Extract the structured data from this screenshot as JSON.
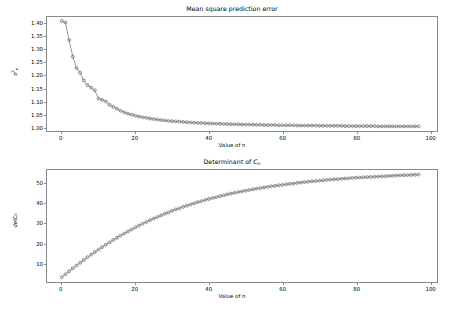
{
  "figure": {
    "background": "#ffffff",
    "frame_color": "#8a8a8a",
    "marker_color": "#6b6b6b",
    "line_color": "#555555"
  },
  "chart_data": [
    {
      "type": "line",
      "title": "Mean square prediction error",
      "xlabel": "Value of n",
      "ylabel": "σ²ₙ",
      "ylabel_parts": {
        "base": "σ",
        "sup": "2",
        "sub": "n"
      },
      "grid": false,
      "legend": null,
      "marker": "circle",
      "xlim": [
        -4,
        102
      ],
      "ylim": [
        0.985,
        1.425
      ],
      "xticks": [
        0,
        20,
        40,
        60,
        80,
        100
      ],
      "xticklabels": [
        "0",
        "20",
        "40",
        "60",
        "80",
        "100"
      ],
      "yticks": [
        1.0,
        1.05,
        1.1,
        1.15,
        1.2,
        1.25,
        1.3,
        1.35,
        1.4
      ],
      "yticklabels": [
        "1.00",
        "1.05",
        "1.10",
        "1.15",
        "1.20",
        "1.25",
        "1.30",
        "1.35",
        "1.40"
      ],
      "x": [
        0,
        1,
        2,
        3,
        4,
        5,
        6,
        7,
        8,
        9,
        10,
        11,
        12,
        13,
        14,
        15,
        16,
        17,
        18,
        19,
        20,
        21,
        22,
        23,
        24,
        25,
        26,
        27,
        28,
        29,
        30,
        31,
        32,
        33,
        34,
        35,
        36,
        37,
        38,
        39,
        40,
        41,
        42,
        43,
        44,
        45,
        46,
        47,
        48,
        49,
        50,
        51,
        52,
        53,
        54,
        55,
        56,
        57,
        58,
        59,
        60,
        61,
        62,
        63,
        64,
        65,
        66,
        67,
        68,
        69,
        70,
        71,
        72,
        73,
        74,
        75,
        76,
        77,
        78,
        79,
        80,
        81,
        82,
        83,
        84,
        85,
        86,
        87,
        88,
        89,
        90,
        91,
        92,
        93,
        94,
        95,
        96,
        97
      ],
      "y": [
        1.41,
        1.404,
        1.336,
        1.272,
        1.228,
        1.21,
        1.18,
        1.162,
        1.152,
        1.142,
        1.11,
        1.105,
        1.099,
        1.086,
        1.078,
        1.071,
        1.063,
        1.057,
        1.052,
        1.048,
        1.044,
        1.041,
        1.038,
        1.036,
        1.033,
        1.031,
        1.029,
        1.027,
        1.026,
        1.024,
        1.023,
        1.022,
        1.021,
        1.02,
        1.019,
        1.018,
        1.017,
        1.016,
        1.016,
        1.015,
        1.014,
        1.014,
        1.013,
        1.013,
        1.012,
        1.012,
        1.011,
        1.011,
        1.011,
        1.01,
        1.01,
        1.01,
        1.009,
        1.009,
        1.009,
        1.008,
        1.008,
        1.008,
        1.008,
        1.007,
        1.007,
        1.007,
        1.007,
        1.007,
        1.006,
        1.006,
        1.006,
        1.006,
        1.006,
        1.006,
        1.005,
        1.005,
        1.005,
        1.005,
        1.005,
        1.005,
        1.005,
        1.004,
        1.004,
        1.004,
        1.004,
        1.004,
        1.004,
        1.004,
        1.004,
        1.004,
        1.003,
        1.003,
        1.003,
        1.003,
        1.003,
        1.003,
        1.003,
        1.003,
        1.003,
        1.003,
        1.003,
        1.003
      ]
    },
    {
      "type": "line",
      "title": "Determinant of Cₙ",
      "title_parts": {
        "prefix": "Determinant of ",
        "base": "C",
        "sub": "n"
      },
      "xlabel": "Value of n",
      "ylabel": "detCₙ",
      "ylabel_parts": {
        "base": "detC",
        "sub": "n"
      },
      "grid": false,
      "legend": null,
      "marker": "circle",
      "xlim": [
        -4,
        102
      ],
      "ylim": [
        0.5,
        57
      ],
      "xticks": [
        0,
        20,
        40,
        60,
        80,
        100
      ],
      "xticklabels": [
        "0",
        "20",
        "40",
        "60",
        "80",
        "100"
      ],
      "yticks": [
        10,
        20,
        30,
        40,
        50
      ],
      "yticklabels": [
        "10",
        "20",
        "30",
        "40",
        "50"
      ],
      "x": [
        0,
        1,
        2,
        3,
        4,
        5,
        6,
        7,
        8,
        9,
        10,
        11,
        12,
        13,
        14,
        15,
        16,
        17,
        18,
        19,
        20,
        21,
        22,
        23,
        24,
        25,
        26,
        27,
        28,
        29,
        30,
        31,
        32,
        33,
        34,
        35,
        36,
        37,
        38,
        39,
        40,
        41,
        42,
        43,
        44,
        45,
        46,
        47,
        48,
        49,
        50,
        51,
        52,
        53,
        54,
        55,
        56,
        57,
        58,
        59,
        60,
        61,
        62,
        63,
        64,
        65,
        66,
        67,
        68,
        69,
        70,
        71,
        72,
        73,
        74,
        75,
        76,
        77,
        78,
        79,
        80,
        81,
        82,
        83,
        84,
        85,
        86,
        87,
        88,
        89,
        90,
        91,
        92,
        93,
        94,
        95,
        96,
        97
      ],
      "y": [
        2.9,
        4.4,
        5.9,
        7.4,
        8.8,
        10.2,
        11.6,
        13.0,
        14.3,
        15.6,
        16.9,
        18.1,
        19.3,
        20.5,
        21.7,
        22.8,
        23.9,
        25.0,
        26.0,
        27.0,
        28.0,
        29.0,
        29.9,
        30.8,
        31.7,
        32.5,
        33.3,
        34.1,
        34.9,
        35.6,
        36.4,
        37.1,
        37.7,
        38.4,
        39.0,
        39.6,
        40.2,
        40.8,
        41.3,
        41.9,
        42.4,
        42.9,
        43.3,
        43.8,
        44.2,
        44.7,
        45.1,
        45.5,
        45.9,
        46.2,
        46.6,
        46.9,
        47.3,
        47.6,
        47.9,
        48.2,
        48.5,
        48.8,
        49.0,
        49.3,
        49.5,
        49.8,
        50.0,
        50.2,
        50.5,
        50.7,
        50.9,
        51.1,
        51.3,
        51.4,
        51.6,
        51.8,
        52.0,
        52.1,
        52.3,
        52.4,
        52.6,
        52.7,
        52.8,
        53.0,
        53.1,
        53.2,
        53.3,
        53.4,
        53.5,
        53.6,
        53.7,
        53.8,
        53.9,
        54.0,
        54.1,
        54.2,
        54.3,
        54.4,
        54.4,
        54.5,
        54.6,
        54.7
      ]
    }
  ]
}
